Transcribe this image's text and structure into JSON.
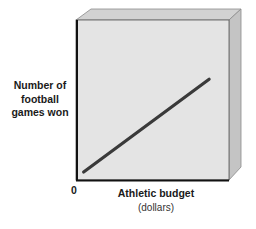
{
  "chart_data": {
    "type": "line",
    "title": "",
    "xlabel": "Athletic budget",
    "xlabel_unit": "(dollars)",
    "ylabel": "Number of football games won",
    "ylabel_lines": [
      "Number of",
      "football",
      "games won"
    ],
    "origin_label": "0",
    "grid": false,
    "legend": null,
    "series": [
      {
        "name": "Relationship",
        "trend": "positive linear",
        "x": [
          0.05,
          0.87
        ],
        "y": [
          0.05,
          0.63
        ]
      }
    ],
    "xlim": [
      0,
      1
    ],
    "ylim": [
      0,
      1
    ],
    "colors": {
      "plot_face": "#e4e4e4",
      "top_face": "#d2d2d2",
      "side_face": "#c4c4c4",
      "line": "#3a3a3a",
      "axes": "#111111"
    }
  }
}
